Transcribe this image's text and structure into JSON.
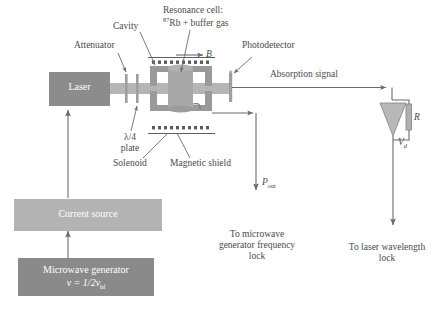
{
  "diagram": {
    "colors": {
      "laser_box": "#8c8c8c",
      "current_source_box": "#b3b3b3",
      "microwave_box": "#8a8a8a",
      "beam": "#b0b0b0",
      "cavity": "#9a9a9a",
      "cell": "#a6a6a6",
      "line": "#6b6b6b",
      "text": "#4a4a4a"
    }
  },
  "boxes": {
    "laser": {
      "label": "Laser"
    },
    "current_source": {
      "label": "Current source"
    },
    "microwave_generator": {
      "line1": "Microwave generator",
      "formula_prefix": "ν = 1/2ν",
      "formula_sub": "hf"
    }
  },
  "labels": {
    "attenuator": "Attenuator",
    "cavity": "Cavity",
    "resonance_cell_line1": "Resonance cell:",
    "resonance_cell_sup": "87",
    "resonance_cell_line2": "Rb + buffer gas",
    "photodetector": "Photodetector",
    "b_field": "B",
    "absorption_signal": "Absorption signal",
    "quarter_wave_line1": "λ/4",
    "quarter_wave_line2": "plate",
    "solenoid": "Solenoid",
    "magnetic_shield": "Magnetic shield",
    "p_out_main": "P",
    "p_out_sub": "out",
    "resistor": "R",
    "vd_main": "V",
    "vd_sub": "d",
    "to_microwave_line1": "To microwave",
    "to_microwave_line2": "generator frequency",
    "to_microwave_line3": "lock",
    "to_laser_line1": "To laser wavelength",
    "to_laser_line2": "lock"
  }
}
